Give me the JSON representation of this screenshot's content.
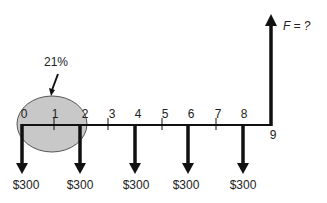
{
  "diagram": {
    "type": "cash-flow-diagram",
    "interest_rate_label": "21%",
    "future_value_label": "F = ?",
    "periods": [
      "0",
      "1",
      "2",
      "3",
      "4",
      "5",
      "6",
      "7",
      "8",
      "9"
    ],
    "payments": [
      {
        "period": "0",
        "amount": "$300"
      },
      {
        "period": "2",
        "amount": "$300"
      },
      {
        "period": "4",
        "amount": "$300"
      },
      {
        "period": "6",
        "amount": "$300"
      },
      {
        "period": "8",
        "amount": "$300"
      }
    ],
    "colors": {
      "line": "#111111",
      "ellipse_fill": "#c8c8c8",
      "ellipse_stroke": "#555555",
      "text": "#222222"
    }
  }
}
